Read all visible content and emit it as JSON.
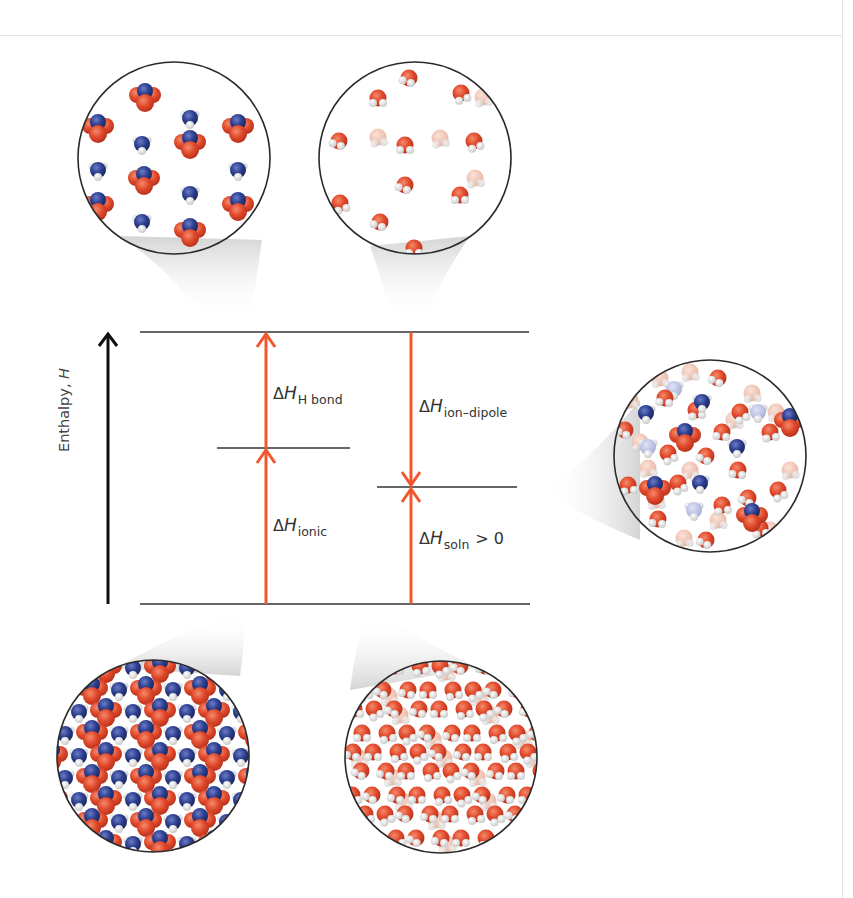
{
  "diagram": {
    "axis": {
      "label": "Enthalpy, ",
      "variable": "H"
    },
    "colors": {
      "arrow": "#f0572f",
      "level": "#333333",
      "axis": "#111111",
      "oxygen": "#e0492c",
      "nitrogen": "#2c3f8f",
      "hydrogen": "#f2f2f2",
      "faded_oxygen": "#f0c4b4",
      "faded_nitrogen": "#b9bfe0"
    },
    "levels": [
      {
        "name": "separated-ions-and-water",
        "y": 332,
        "x1": 140,
        "x2": 529
      },
      {
        "name": "separated-ions-hbonded-water",
        "y": 448,
        "x1": 217,
        "x2": 350
      },
      {
        "name": "solution",
        "y": 487,
        "x1": 377,
        "x2": 517
      },
      {
        "name": "ionic-solid-and-water",
        "y": 604,
        "x1": 140,
        "x2": 530
      }
    ],
    "arrows": [
      {
        "name": "delta-h-ionic",
        "x": 266,
        "y_from": 604,
        "y_to": 450,
        "direction": "up"
      },
      {
        "name": "delta-h-h-bond",
        "x": 266,
        "y_from": 448,
        "y_to": 334,
        "direction": "up"
      },
      {
        "name": "delta-h-ion-dipole",
        "x": 411,
        "y_from": 332,
        "y_to": 485,
        "direction": "down"
      },
      {
        "name": "delta-h-soln",
        "x": 411,
        "y_from": 604,
        "y_to": 489,
        "direction": "up"
      }
    ],
    "labels": {
      "h_bond": {
        "delta": "Δ",
        "h": "H",
        "sub": "H bond",
        "rest": ""
      },
      "ionic": {
        "delta": "Δ",
        "h": "H",
        "sub": "ionic",
        "rest": ""
      },
      "ion_dipole": {
        "delta": "Δ",
        "h": "H",
        "sub": "ion–dipole",
        "rest": ""
      },
      "soln": {
        "delta": "Δ",
        "h": "H",
        "sub": "soln",
        "rest": "> 0"
      }
    },
    "circles": [
      {
        "name": "separated-ions",
        "cx": 174,
        "cy": 158,
        "r": 96,
        "beam_to": [
          236,
          318
        ]
      },
      {
        "name": "separated-water",
        "cx": 415,
        "cy": 158,
        "r": 96,
        "beam_to": [
          405,
          318
        ]
      },
      {
        "name": "solution-mixture",
        "cx": 710,
        "cy": 456,
        "r": 96,
        "beam_to": [
          545,
          492
        ]
      },
      {
        "name": "ionic-solid",
        "cx": 153,
        "cy": 756,
        "r": 96,
        "beam_to": [
          238,
          615
        ]
      },
      {
        "name": "liquid-water",
        "cx": 441,
        "cy": 757,
        "r": 96,
        "beam_to": [
          368,
          615
        ]
      }
    ]
  }
}
